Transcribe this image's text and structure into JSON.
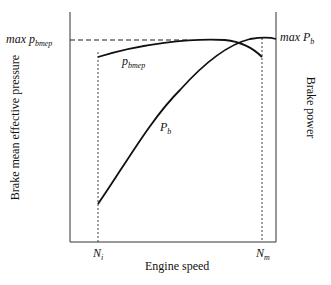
{
  "diagram": {
    "type": "engine performance curves",
    "xlabel": "Engine speed",
    "ylabel_left": "Brake mean effective pressure",
    "ylabel_right": "Brake power",
    "x_ticks": [
      {
        "main": "N",
        "sub": "i"
      },
      {
        "main": "N",
        "sub": "m"
      }
    ],
    "labels": {
      "max_pbmep_main": "max p",
      "max_pbmep_sub": "bmep",
      "max_pb_main": "max P",
      "max_pb_sub": "b",
      "pbmep_main": "p",
      "pbmep_sub": "bmep",
      "pb_main": "P",
      "pb_sub": "b"
    },
    "curves": [
      {
        "name": "p_bmep",
        "description": "rises slightly from N_i to a maximum around mid-speed, then falls toward N_m"
      },
      {
        "name": "P_b",
        "description": "rises steeply from N_i to its maximum near N_m"
      }
    ]
  }
}
